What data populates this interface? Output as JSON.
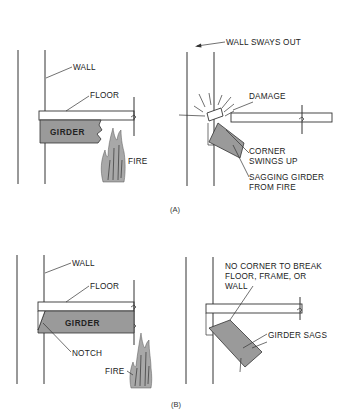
{
  "figure": {
    "panel_a": {
      "label": "(A)",
      "left": {
        "wall": "WALL",
        "floor": "FLOOR",
        "girder": "GIRDER",
        "fire": "FIRE"
      },
      "right": {
        "wall_sways": "WALL SWAYS OUT",
        "damage": "DAMAGE",
        "corner_1": "CORNER",
        "corner_2": "SWINGS UP",
        "sagging_1": "SAGGING GIRDER",
        "sagging_2": "FROM FIRE"
      }
    },
    "panel_b": {
      "label": "(B)",
      "left": {
        "wall": "WALL",
        "floor": "FLOOR",
        "girder": "GIRDER",
        "notch": "NOTCH",
        "fire": "FIRE"
      },
      "right": {
        "no_corner_1": "NO CORNER TO BREAK",
        "no_corner_2": "FLOOR, FRAME, OR",
        "no_corner_3": "WALL",
        "girder_sags": "GIRDER SAGS"
      }
    }
  },
  "colors": {
    "line": "#333333",
    "girder_fill": "#9a9a9a",
    "fire_fill": "#a8a8a8"
  }
}
